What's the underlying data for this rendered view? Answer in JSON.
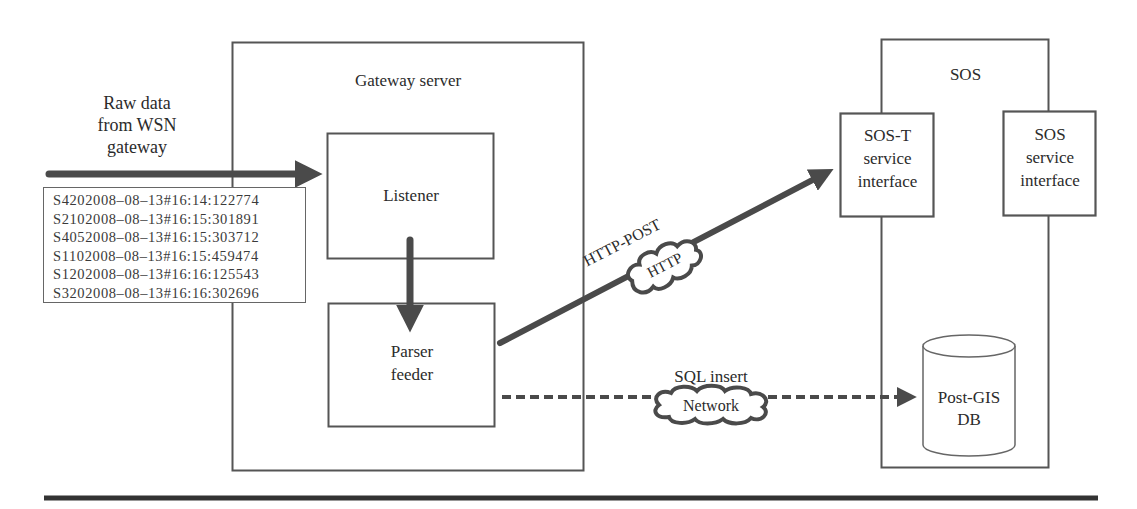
{
  "diagram": {
    "input": {
      "label_lines": [
        "Raw data",
        "from WSN",
        "gateway"
      ],
      "raw_records": [
        "S4202008–08–13#16:14:122774",
        "S2102008–08–13#16:15:301891",
        "S4052008–08–13#16:15:303712",
        "S1102008–08–13#16:15:459474",
        "S1202008–08–13#16:16:125543",
        "S3202008–08–13#16:16:302696"
      ]
    },
    "gateway_server": {
      "title": "Gateway server",
      "listener": {
        "label": "Listener"
      },
      "parser_feeder": {
        "label_lines": [
          "Parser",
          "feeder"
        ]
      }
    },
    "http_link": {
      "label": "HTTP-POST",
      "cloud_label": "HTTP"
    },
    "sql_link": {
      "label": "SQL insert",
      "cloud_label": "Network"
    },
    "sos": {
      "title": "SOS",
      "sos_t_interface": {
        "label_lines": [
          "SOS-T",
          "service",
          "interface"
        ]
      },
      "sos_interface": {
        "label_lines": [
          "SOS",
          "service",
          "interface"
        ]
      },
      "database": {
        "label_lines": [
          "Post-GIS",
          "DB"
        ]
      }
    },
    "colors": {
      "line": "#555555",
      "arrow": "#4a4a4a",
      "text": "#2b2b2b",
      "background": "#ffffff"
    }
  }
}
